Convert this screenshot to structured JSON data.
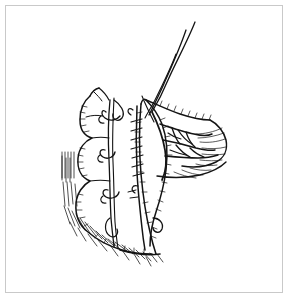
{
  "figure": {
    "domain": "Diagram",
    "kind": "line-art medical illustration",
    "title": "",
    "caption": "",
    "background_color": "#ffffff",
    "ink_color": "#141414",
    "border_color": "#c9c9c9",
    "canvas": {
      "width": 289,
      "height": 299
    },
    "border": {
      "x": 5,
      "y": 5,
      "width": 278,
      "height": 288,
      "thickness": 1
    },
    "labels": [],
    "annotations": [],
    "parts": [
      {
        "name": "bowel-loop-left",
        "description": "scalloped haustrated bowel segment on the left"
      },
      {
        "name": "bowel-loop-right",
        "description": "bowel segment to the right of the suture line"
      },
      {
        "name": "running-suture-line",
        "description": "central running suture closing the anastomosis"
      },
      {
        "name": "suture-thread-long-a",
        "description": "long suture strand extending to upper right"
      },
      {
        "name": "suture-thread-long-b",
        "description": "second long suture strand extending to upper right"
      },
      {
        "name": "stay-suture-knots",
        "description": "knotted stay sutures along the left seam"
      },
      {
        "name": "mesentery-fan",
        "description": "fan of mesenteric vessels on the right"
      },
      {
        "name": "hatched-shading",
        "description": "hatch shading along the lower left contour"
      }
    ]
  }
}
